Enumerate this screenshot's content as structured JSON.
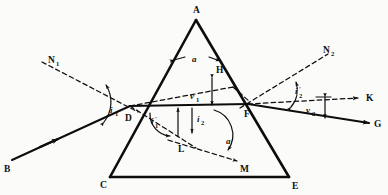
{
  "figure": {
    "kind": "optics-ray-diagram",
    "background_color": "#fbfbfa",
    "ink_color": "#0d0d0d"
  },
  "labels": {
    "apex": "A",
    "base_left": "C",
    "base_right": "E",
    "incident_start": "B",
    "entry_point": "D",
    "exit_point": "F",
    "emergent_end": "G",
    "undeviated_end": "K",
    "normal_left": "N",
    "normal_left_sub": "1",
    "normal_right": "N",
    "normal_right_sub": "2",
    "aux_point_h": "H",
    "aux_point_l": "L",
    "aux_point_m": "M"
  },
  "angles": {
    "incidence": {
      "symbol": "i",
      "sub": "1",
      "prime": ""
    },
    "refraction_inner_left": {
      "symbol": "i",
      "sub": "1",
      "prime": "'"
    },
    "refraction_inner_right": {
      "symbol": "i",
      "sub": "2",
      "prime": ""
    },
    "emergence": {
      "symbol": "i",
      "sub": "2",
      "prime": "'"
    },
    "prism_apex": {
      "symbol": "a",
      "sub": "",
      "prime": ""
    },
    "prism_apex_alt": {
      "symbol": "a",
      "sub": "",
      "prime": ""
    }
  },
  "deviations": {
    "first": {
      "symbol": "v",
      "sub": "1"
    },
    "second": {
      "symbol": "v",
      "sub": "2"
    }
  },
  "geometry": {
    "vertex_a": [
      196,
      20
    ],
    "vertex_c": [
      110,
      177
    ],
    "vertex_e": [
      289,
      177
    ],
    "point_d": [
      130,
      106
    ],
    "point_f": [
      248,
      104
    ],
    "point_b": [
      12,
      160
    ],
    "point_g": [
      369,
      123
    ],
    "point_k": [
      362,
      98
    ]
  }
}
